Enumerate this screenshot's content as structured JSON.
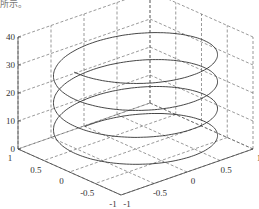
{
  "caption": "所示。",
  "chart_data": {
    "type": "line3d",
    "title": "",
    "xlabel": "",
    "ylabel": "",
    "zlabel": "",
    "equation": "x = sin(t), y = cos(t), z = t",
    "t_range": [
      0,
      12.566
    ],
    "xlim": [
      -1,
      1
    ],
    "ylim": [
      -1,
      1
    ],
    "zlim": [
      0,
      40
    ],
    "x_ticks": [
      "-1",
      "-0.5",
      "0",
      "0.5",
      "1"
    ],
    "y_ticks": [
      "-1",
      "-0.5",
      "0",
      "0.5",
      "1"
    ],
    "z_ticks": [
      "0",
      "10",
      "20",
      "30",
      "40"
    ],
    "grid": true,
    "grid_style": "dashed",
    "line_color": "#333333"
  },
  "axes": {
    "z_ticks": [
      "40",
      "30",
      "20",
      "10",
      "0"
    ],
    "left_ticks": [
      "1",
      "0.5",
      "0",
      "-0.5",
      "-1"
    ],
    "right_ticks": [
      "-1",
      "-0.5",
      "0",
      "0.5",
      "1"
    ]
  }
}
